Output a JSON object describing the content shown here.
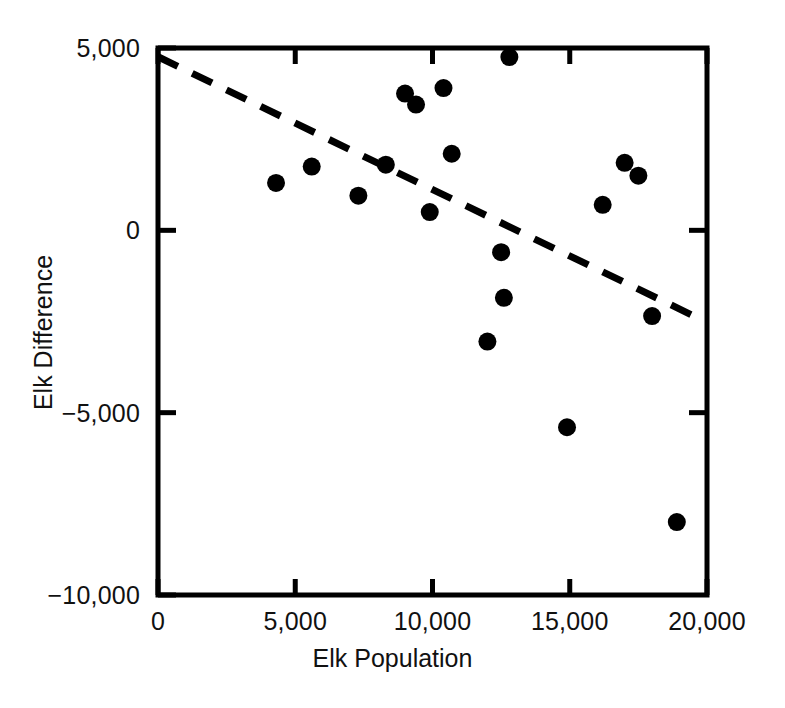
{
  "chart_data": {
    "type": "scatter",
    "title": "",
    "xlabel": "Elk Population",
    "ylabel": "Elk Difference",
    "xlim": [
      0,
      20000
    ],
    "ylim": [
      -10000,
      5000
    ],
    "grid": false,
    "legend": "none",
    "xticks": [
      0,
      5000,
      10000,
      15000,
      20000
    ],
    "xtick_labels": [
      "0",
      "5,000",
      "10,000",
      "15,000",
      "20,000"
    ],
    "yticks": [
      5000,
      0,
      -5000,
      -10000
    ],
    "ytick_labels": [
      "5,000",
      "0",
      "−5,000",
      "−10,000"
    ],
    "marker": {
      "shape": "circle",
      "color": "#000000",
      "radius_px": 9
    },
    "points": [
      {
        "x": 4300,
        "y": 1300
      },
      {
        "x": 5600,
        "y": 1750
      },
      {
        "x": 7300,
        "y": 950
      },
      {
        "x": 8300,
        "y": 1800
      },
      {
        "x": 9000,
        "y": 3750
      },
      {
        "x": 9400,
        "y": 3450
      },
      {
        "x": 9900,
        "y": 500
      },
      {
        "x": 10700,
        "y": 2100
      },
      {
        "x": 10400,
        "y": 3900
      },
      {
        "x": 12800,
        "y": 4750
      },
      {
        "x": 12500,
        "y": -600
      },
      {
        "x": 12600,
        "y": -1850
      },
      {
        "x": 12000,
        "y": -3050
      },
      {
        "x": 14900,
        "y": -5400
      },
      {
        "x": 16200,
        "y": 700
      },
      {
        "x": 17000,
        "y": 1850
      },
      {
        "x": 17500,
        "y": 1500
      },
      {
        "x": 18000,
        "y": -2350
      },
      {
        "x": 18900,
        "y": -8000
      }
    ],
    "trendline": {
      "style": "dashed",
      "color": "#000000",
      "width_px": 7,
      "x0": 0,
      "y0": 4760,
      "x1": 19800,
      "y1": -2450
    },
    "axis": {
      "color": "#000000",
      "spines": [
        "left",
        "bottom",
        "top",
        "right"
      ],
      "line_width_px": 5
    }
  }
}
